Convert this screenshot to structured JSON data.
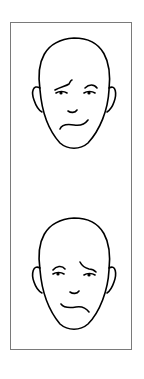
{
  "figure": {
    "description": "Two line-drawn bald faces with asymmetric expressions stacked vertically in a bordered frame",
    "faces": [
      {
        "label": "Face 1",
        "expression": "left brow raised, mouth lopsided"
      },
      {
        "label": "Face 2",
        "expression": "right brow raised, mouth lopsided"
      }
    ],
    "colors": {
      "line": "#000000",
      "border": "#7a7a7a",
      "background": "#ffffff"
    }
  }
}
